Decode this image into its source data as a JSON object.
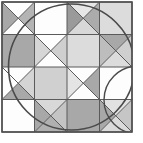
{
  "figure": {
    "type": "geometric-tiling",
    "width": 143,
    "height": 143,
    "background_color": "#ffffff"
  },
  "palette": {
    "white": "#fdfdfd",
    "very_light_gray": "#eeeeee",
    "light_gray": "#dcdcdc",
    "mid_gray": "#c2c2c2",
    "gray": "#ababab",
    "dark_gray": "#8f8f8f",
    "line": "#5a5a5a",
    "border": "#4f4f4f"
  },
  "grid": {
    "rows": 4,
    "cols": 4,
    "origin_x": 2,
    "origin_y": 2,
    "cell_size": 32.5,
    "stroke_color": "#5a5a5a",
    "stroke_width": 1
  },
  "cells": [
    {
      "row": 0,
      "col": 0,
      "name": "cell-r1c1",
      "pattern": "hourglass-horizontal",
      "fills": {
        "top": "#fdfdfd",
        "right": "#b4b4b4",
        "bottom": "#fdfdfd",
        "left": "#a8a8a8"
      }
    },
    {
      "row": 0,
      "col": 1,
      "name": "cell-r1c2",
      "pattern": "solid",
      "fills": {
        "all": "#fdfdfd"
      }
    },
    {
      "row": 0,
      "col": 2,
      "name": "cell-r1c3",
      "pattern": "hourglass-horizontal",
      "fills": {
        "top": "#e6e6e6",
        "right": "#ababab",
        "bottom": "#d8d8d8",
        "left": "#9a9a9a"
      }
    },
    {
      "row": 0,
      "col": 3,
      "name": "cell-r1c4",
      "pattern": "solid",
      "fills": {
        "all": "#dcdcdc"
      }
    },
    {
      "row": 1,
      "col": 0,
      "name": "cell-r2c1",
      "pattern": "solid",
      "fills": {
        "all": "#a8a8a8"
      }
    },
    {
      "row": 1,
      "col": 1,
      "name": "cell-r2c2",
      "pattern": "hourglass-horizontal",
      "fills": {
        "top": "#fdfdfd",
        "right": "#cfcfcf",
        "bottom": "#fdfdfd",
        "left": "#d6d6d6"
      }
    },
    {
      "row": 1,
      "col": 2,
      "name": "cell-r2c3",
      "pattern": "solid",
      "fills": {
        "all": "#dcdcdc"
      }
    },
    {
      "row": 1,
      "col": 3,
      "name": "cell-r2c4",
      "pattern": "four-triangle",
      "fills": {
        "top": "#a8a8a8",
        "right": "#cfcfcf",
        "bottom": "#dcdcdc",
        "left": "#bdbdbd"
      }
    },
    {
      "row": 2,
      "col": 0,
      "name": "cell-r3c1",
      "pattern": "four-triangle",
      "fills": {
        "top": "#fdfdfd",
        "right": "#d4d4d4",
        "bottom": "#a8a8a8",
        "left": "#fdfdfd"
      }
    },
    {
      "row": 2,
      "col": 1,
      "name": "cell-r3c2",
      "pattern": "solid",
      "fills": {
        "all": "#d0d0d0"
      }
    },
    {
      "row": 2,
      "col": 2,
      "name": "cell-r3c3",
      "pattern": "four-triangle",
      "fills": {
        "top": "#fdfdfd",
        "right": "#a8a8a8",
        "bottom": "#fdfdfd",
        "left": "#e4e4e4"
      }
    },
    {
      "row": 2,
      "col": 3,
      "name": "cell-r3c4",
      "pattern": "solid",
      "fills": {
        "all": "#fdfdfd"
      }
    },
    {
      "row": 3,
      "col": 0,
      "name": "cell-r4c1",
      "pattern": "solid",
      "fills": {
        "all": "#fdfdfd"
      }
    },
    {
      "row": 3,
      "col": 1,
      "name": "cell-r4c2",
      "pattern": "four-triangle",
      "fills": {
        "top": "#d8d8d8",
        "right": "#c4c4c4",
        "bottom": "#b0b0b0",
        "left": "#a8a8a8"
      }
    },
    {
      "row": 3,
      "col": 2,
      "name": "cell-r4c3",
      "pattern": "solid",
      "fills": {
        "all": "#a8a8a8"
      }
    },
    {
      "row": 3,
      "col": 3,
      "name": "cell-r4c4",
      "pattern": "four-triangle",
      "fills": {
        "top": "#e2e2e2",
        "right": "#c6c6c6",
        "bottom": "#dadada",
        "left": "#a8a8a8"
      }
    }
  ],
  "overlays": {
    "main_circle": {
      "name": "inscribed-circle",
      "cx": 71.5,
      "cy": 67,
      "r": 63,
      "stroke": "#4a4a4a",
      "stroke_width": 1.6,
      "fill": "none"
    },
    "corner_arc": {
      "name": "corner-arc",
      "cx": 138,
      "cy": 100,
      "r": 34,
      "stroke": "#4a4a4a",
      "stroke_width": 1.4,
      "fill": "none"
    },
    "outer_border": {
      "name": "outer-border",
      "x": 2,
      "y": 2,
      "w": 130,
      "h": 130,
      "stroke": "#4f4f4f",
      "stroke_width": 1.6,
      "fill": "none"
    }
  },
  "labels": {
    "alt_text": "Black and white quilt pattern of gray and white triangles in a four by four grid overlaid by a circle"
  }
}
